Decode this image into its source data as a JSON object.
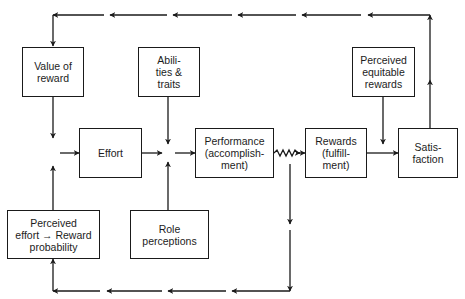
{
  "diagram": {
    "type": "flow-model",
    "colors": {
      "line": "#1a1a1a",
      "background": "#ffffff",
      "text": "#1c1c1c"
    },
    "boxes": {
      "value_of_reward": "Value of\nreward",
      "abilities_traits": "Abili-\nties &\ntraits",
      "perceived_equitable_rewards": "Perceived\nequitable\nrewards",
      "effort": "Effort",
      "performance": "Performance\n(accomplish-\nment)",
      "rewards": "Rewards\n(fulfill-\nment)",
      "satisfaction": "Satis-\nfaction",
      "perceived_effort_reward_probability": "Perceived\neffort → Reward\nprobability",
      "role_perceptions": "Role\nperceptions"
    },
    "connections": [
      {
        "from": "Value of reward",
        "to": "Effort"
      },
      {
        "from": "Perceived effort → Reward probability",
        "to": "Effort"
      },
      {
        "from": "Effort",
        "to": "Performance"
      },
      {
        "from": "Abilities & traits",
        "to": "Performance"
      },
      {
        "from": "Role perceptions",
        "to": "Performance"
      },
      {
        "from": "Performance",
        "to": "Rewards",
        "style": "wavy"
      },
      {
        "from": "Rewards",
        "to": "Satisfaction"
      },
      {
        "from": "Perceived equitable rewards",
        "to": "Satisfaction"
      },
      {
        "from": "Satisfaction",
        "to": "Value of reward",
        "style": "feedback-top"
      },
      {
        "from": "Performance",
        "to": "Perceived effort → Reward probability",
        "style": "feedback-bottom"
      }
    ]
  }
}
